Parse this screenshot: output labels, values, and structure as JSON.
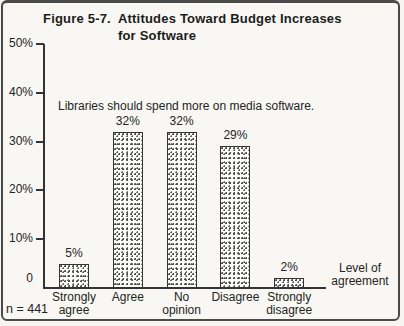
{
  "figure": {
    "label": "Figure 5-7.",
    "title": "Attitudes Toward Budget Increases\nfor Software"
  },
  "annotation": "Libraries should spend more on media software.",
  "axis_title": "Level of\nagreement",
  "sample_size_label": "n = 441",
  "colors": {
    "ink": "#333333",
    "paper": "#f8f7f3",
    "bar_fill": "#fdfdfa",
    "bar_stipple": "#4d4d4d"
  },
  "chart_data": {
    "type": "bar",
    "title": "Figure 5-7. Attitudes Toward Budget Increases for Software",
    "annotation": "Libraries should spend more on media software.",
    "categories": [
      "Strongly\nagree",
      "Agree",
      "No\nopinion",
      "Disagree",
      "Strongly\ndisagree"
    ],
    "values": [
      5,
      32,
      32,
      29,
      2
    ],
    "value_labels": [
      "5%",
      "32%",
      "32%",
      "29%",
      "2%"
    ],
    "xlabel": "Level of agreement",
    "ylabel": "",
    "ylim": [
      0,
      50
    ],
    "yticks": [
      {
        "value": 50,
        "label": "50%"
      },
      {
        "value": 40,
        "label": "40%"
      },
      {
        "value": 30,
        "label": "30%"
      },
      {
        "value": 20,
        "label": "20%"
      },
      {
        "value": 10,
        "label": "10%"
      },
      {
        "value": 0,
        "label": "0"
      }
    ],
    "sample_size": "n = 441",
    "grid": false,
    "legend": false,
    "bar_pattern": "stipple"
  }
}
